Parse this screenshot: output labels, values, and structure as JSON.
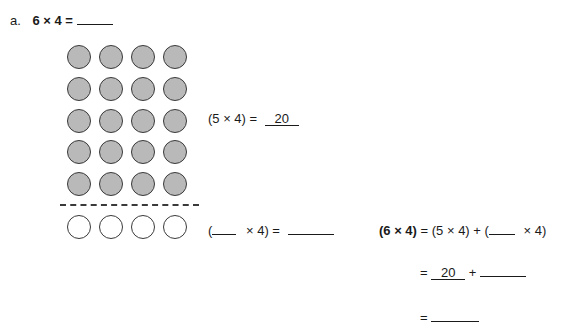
{
  "problem": {
    "label": "a.",
    "prompt": "6 × 4 =",
    "answer_blank": ""
  },
  "array": {
    "columns": 4,
    "filled_rows": 5,
    "empty_rows": 1,
    "filled_color": "#b9b9b9",
    "outline_color": "#3a3a3a"
  },
  "equations": {
    "top": {
      "left": "(5 × 4) =",
      "answer": "20"
    },
    "bottom": {
      "open": "(",
      "blank": "",
      "rest": "× 4) =",
      "answer": ""
    },
    "distributive": {
      "lhs": "(6 × 4)",
      "rhs": "= (5 × 4) + (",
      "blank": "",
      "tail": "× 4)",
      "line2_eq": "=",
      "line2_value": "20",
      "line2_plus": "+",
      "line2_blank": "",
      "line3_eq": "=",
      "line3_blank": ""
    }
  }
}
